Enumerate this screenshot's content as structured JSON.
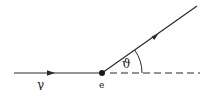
{
  "diagram": {
    "type": "scattering-kinematics",
    "colors": {
      "stroke": "#2a2a2a",
      "background": "#ffffff"
    },
    "incoming": {
      "label": "γ",
      "from": [
        14,
        73
      ],
      "to": [
        102,
        73
      ],
      "arrow_at": [
        54,
        73
      ]
    },
    "vertex": {
      "label": "e",
      "position": [
        102,
        73
      ]
    },
    "outgoing": {
      "from": [
        102,
        73
      ],
      "to": [
        197,
        6
      ],
      "arrow_at": [
        156,
        35
      ]
    },
    "reference_line": {
      "style": "dashed",
      "from": [
        110,
        73
      ],
      "to": [
        200,
        73
      ]
    },
    "angle": {
      "label": "ϑ",
      "arc_radius": 40
    }
  }
}
